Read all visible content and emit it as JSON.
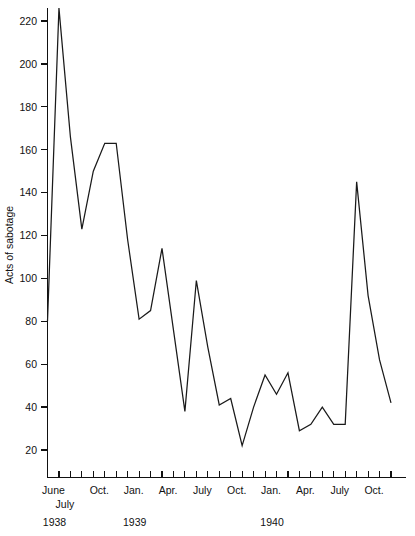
{
  "chart_data": {
    "type": "line",
    "title": "",
    "subtitle": "",
    "xlabel": "",
    "ylabel": "Acts of sabotage",
    "ylim": [
      0,
      230
    ],
    "y_axis_ticks": [
      20,
      40,
      60,
      80,
      100,
      120,
      140,
      160,
      180,
      200,
      220
    ],
    "grid": false,
    "legend": false,
    "legend_position": "none",
    "x_axis_ticks_count": 31,
    "x_tick_labels": [
      {
        "label": "June",
        "index": 0
      },
      {
        "label": "July",
        "index": 1
      },
      {
        "label": "Oct.",
        "index": 4
      },
      {
        "label": "Jan.",
        "index": 7
      },
      {
        "label": "Apr.",
        "index": 10
      },
      {
        "label": "July",
        "index": 13
      },
      {
        "label": "Oct.",
        "index": 16
      },
      {
        "label": "Jan.",
        "index": 19
      },
      {
        "label": "Apr.",
        "index": 22
      },
      {
        "label": "July",
        "index": 25
      },
      {
        "label": "Oct.",
        "index": 28
      }
    ],
    "year_labels": [
      {
        "label": "1938",
        "index": 0
      },
      {
        "label": "1939",
        "index": 7
      },
      {
        "label": "1940",
        "index": 19
      }
    ],
    "categories": [
      "June 1938",
      "July 1938",
      "Aug. 1938",
      "Sept. 1938",
      "Oct. 1938",
      "Nov. 1938",
      "Dec. 1938",
      "Jan. 1939",
      "Feb. 1939",
      "Mar. 1939",
      "Apr. 1939",
      "May 1939",
      "June 1939",
      "July 1939",
      "Aug. 1939",
      "Sept. 1939",
      "Oct. 1939",
      "Nov. 1939",
      "Dec. 1939",
      "Jan. 1940",
      "Feb. 1940",
      "Mar. 1940",
      "Apr. 1940",
      "May 1940",
      "June 1940",
      "July 1940",
      "Aug. 1940",
      "Sept. 1940",
      "Oct. 1940",
      "Nov. 1940",
      "Dec. 1940"
    ],
    "values": [
      80,
      226,
      166,
      123,
      150,
      163,
      163,
      118,
      81,
      85,
      114,
      76,
      38,
      99,
      68,
      41,
      44,
      22,
      40,
      55,
      46,
      56,
      29,
      32,
      40,
      32,
      32,
      145,
      92,
      62,
      42
    ],
    "series": [
      {
        "name": "Acts of sabotage",
        "values": [
          80,
          226,
          166,
          123,
          150,
          163,
          163,
          118,
          81,
          85,
          114,
          76,
          38,
          99,
          68,
          41,
          44,
          22,
          40,
          55,
          46,
          56,
          29,
          32,
          40,
          32,
          32,
          145,
          92,
          62,
          42
        ]
      }
    ],
    "colors": {
      "line": "#1a1a1a",
      "axis": "#111111",
      "background": "#ffffff"
    }
  }
}
